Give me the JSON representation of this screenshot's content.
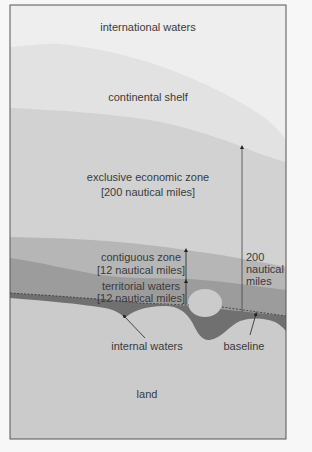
{
  "zones": {
    "international_waters": {
      "label": "international waters",
      "color": "#eeeeee"
    },
    "continental_shelf": {
      "label": "continental shelf",
      "color": "#e2e2e2"
    },
    "eez": {
      "label": "exclusive economic zone",
      "sublabel": "[200 nautical miles]",
      "color": "#d2d2d2"
    },
    "contiguous": {
      "label": "contiguous zone",
      "sublabel": "[12 nautical miles]",
      "color": "#b6b6b6"
    },
    "territorial": {
      "label": "territorial waters",
      "sublabel": "[12 nautical miles]",
      "color": "#9c9c9c"
    },
    "internal": {
      "label": "internal waters",
      "color": "#707070"
    },
    "land": {
      "label": "land",
      "color": "#cbcbcb"
    }
  },
  "annotations": {
    "distance_line1": "200",
    "distance_line2": "nautical",
    "distance_line3": "miles",
    "baseline": "baseline"
  },
  "frame_color": "#555555"
}
